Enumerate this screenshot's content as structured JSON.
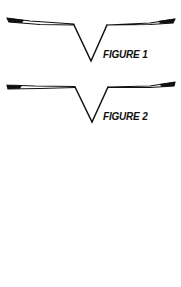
{
  "figures": [
    {
      "label": "FIGURE 1",
      "shape": "v-profile"
    },
    {
      "label": "FIGURE 2",
      "shape": "v-profile"
    }
  ],
  "colors": {
    "ink": "#111111",
    "background": "#ffffff"
  }
}
